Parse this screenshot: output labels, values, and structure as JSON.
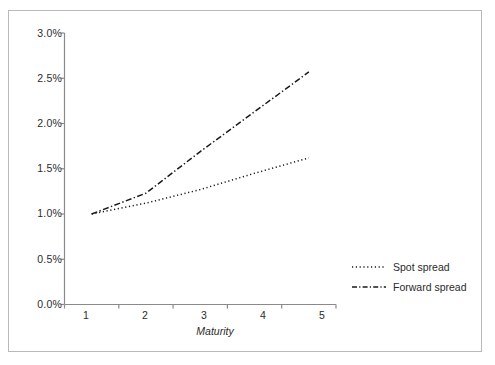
{
  "chart_data": {
    "type": "line",
    "title": "",
    "xlabel": "Maturity",
    "ylabel": "",
    "x": [
      1,
      2,
      3,
      4,
      5
    ],
    "xticklabels": [
      "1",
      "2",
      "3",
      "4",
      "5"
    ],
    "yticklabels": [
      "0.0%",
      "0.5%",
      "1.0%",
      "1.5%",
      "2.0%",
      "2.5%",
      "3.0%"
    ],
    "ytickvalues": [
      0.0,
      0.5,
      1.0,
      1.5,
      2.0,
      2.5,
      3.0
    ],
    "ylim": [
      0.0,
      3.0
    ],
    "xlim": [
      1,
      5
    ],
    "grid": false,
    "legend_position": "right-lower",
    "units": "percent",
    "series": [
      {
        "name": "Spot spread",
        "linestyle": "dotted",
        "color": "#1a1a1a",
        "values": [
          1.0,
          1.12,
          1.27,
          1.45,
          1.62
        ]
      },
      {
        "name": "Forward spread",
        "linestyle": "dash-dot",
        "color": "#1a1a1a",
        "values": [
          1.0,
          1.23,
          1.69,
          2.13,
          2.57
        ]
      }
    ]
  },
  "legend": {
    "items": [
      {
        "label": "Spot spread",
        "style": "dotted"
      },
      {
        "label": "Forward spread",
        "style": "dash-dot"
      }
    ]
  },
  "axes": {
    "x_title": "Maturity",
    "axis_color": "#8a8a8a"
  },
  "colors": {
    "frame": "#b9b9b9",
    "axis": "#8a8a8a",
    "ink": "#2b2b2b",
    "line": "#1a1a1a",
    "background": "#ffffff"
  }
}
